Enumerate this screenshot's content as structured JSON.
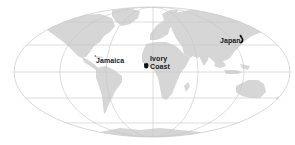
{
  "map": {
    "projection": "mollweide-style world map",
    "colors": {
      "background": "#ffffff",
      "land": "#d4d4d4",
      "graticule": "#c8c8c8",
      "highlight": "#111111",
      "label_text": "#1a1a1a"
    },
    "highlighted_countries": [
      {
        "id": "jamaica",
        "label": "Jamaica"
      },
      {
        "id": "ivory-coast",
        "label_line1": "Ivory",
        "label_line2": "Coast"
      },
      {
        "id": "japan",
        "label": "Japan"
      }
    ]
  }
}
